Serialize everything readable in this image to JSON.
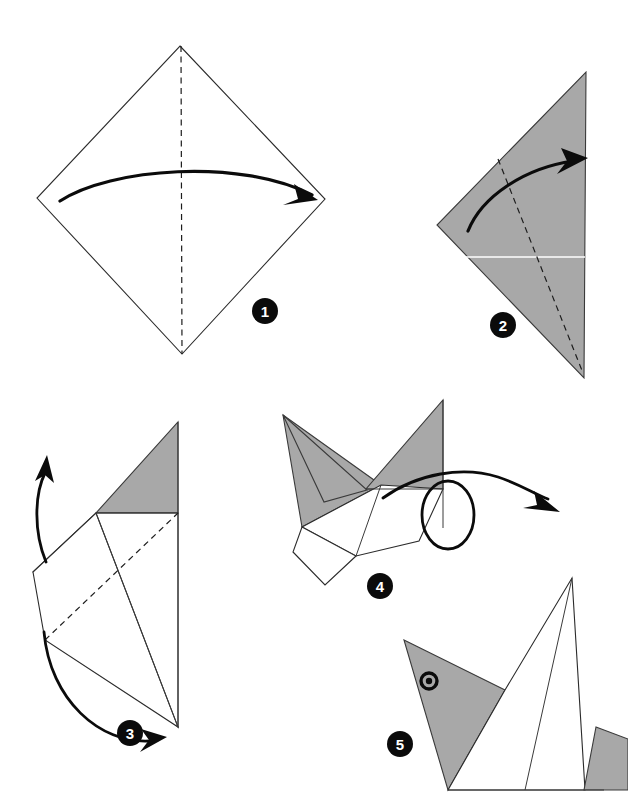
{
  "document": {
    "title": "Origami folding instructions",
    "subject": "paper bird / swan fold sequence",
    "background_color": "#ffffff",
    "width": 628,
    "height": 808
  },
  "palette": {
    "paper_front": "#ffffff",
    "paper_back": "#a8a8a8",
    "ink": "#2b2b2b",
    "arrow": "#0b0b0b",
    "badge_fill": "#0b0b0b",
    "badge_text": "#ffffff",
    "crease_highlight": "#ffffff"
  },
  "steps": [
    {
      "number": "1",
      "badge": {
        "cx": 265,
        "cy": 311,
        "r": 13
      },
      "caption": "Square sheet set as a diamond with a vertical centre crease; fold left point across to the right point.",
      "shape": "diamond",
      "polygon": "180,46 325,199 182,354 37,198",
      "creases": [
        {
          "kind": "dashed-valley",
          "path": "M 181,46 L 182,354"
        }
      ],
      "arrow": {
        "kind": "curved-fold-arrow",
        "path": "M 60,201 C 110,168 240,158 312,195",
        "head": "316,199 297,185 299,200 286,207"
      }
    },
    {
      "number": "2",
      "badge": {
        "cx": 503,
        "cy": 325,
        "r": 13
      },
      "caption": "Resulting triangle, coloured side up, with a horizontal raw edge and a dashed crease; fold the upper left flap over to the right.",
      "shape": "triangle",
      "polygon": "586,72 584,378 437,225",
      "creases": [
        {
          "kind": "white-raw-edge",
          "path": "M 437,257 L 585,257"
        },
        {
          "kind": "dashed-valley",
          "path": "M 498,159 L 583,373"
        }
      ],
      "arrow": {
        "kind": "curved-fold-arrow",
        "path": "M 468,231 C 482,196 525,168 573,161",
        "head": "584,159 562,150 568,162 560,173"
      }
    },
    {
      "number": "3",
      "badge": {
        "cx": 130,
        "cy": 733,
        "r": 13
      },
      "caption": "Narrow kite shape with a grey flap at the top and a dashed crease across the middle; swing the lower left flap upward.",
      "shape": "kite-with-flaps",
      "faces": [
        {
          "fill": "paper_back",
          "polygon": "178,422 178,513 96,513"
        },
        {
          "fill": "paper_front",
          "polygon": "96,513 178,513 178,727 33,572"
        },
        {
          "fill": "paper_front",
          "polygon": "33,572 96,513 178,727 45,640"
        }
      ],
      "creases": [
        {
          "kind": "edge",
          "path": "M 96,513 L 178,727"
        },
        {
          "kind": "edge",
          "path": "M 178,422 L 33,572"
        },
        {
          "kind": "dashed-valley",
          "path": "M 45,640 L 178,513"
        },
        {
          "kind": "edge",
          "path": "M 178,422 L 178,727"
        },
        {
          "kind": "edge",
          "path": "M 96,513 L 178,513"
        }
      ],
      "arrow_up": {
        "kind": "curved-fold-arrow",
        "path": "M 45,560 C 33,528 35,492 44,472",
        "head": "47,458 36,480 45,476 52,483"
      },
      "arrow_sweep": {
        "kind": "curved-fold-arrow",
        "path": "M 44,634 C 52,700 100,742 152,740",
        "head": "166,738 143,730 150,741 142,750"
      }
    },
    {
      "number": "4",
      "badge": {
        "cx": 380,
        "cy": 586,
        "r": 13
      },
      "caption": "Pointed head and wing flaps formed; turn the model over with a rotation arrow.",
      "shape": "head-and-wings",
      "faces": [
        {
          "fill": "paper_back",
          "polygon": "283,415 381,485 302,527"
        },
        {
          "fill": "paper_back",
          "polygon": "283,415 367,489 325,501"
        },
        {
          "fill": "paper_back",
          "polygon": "443,400 443,489 366,489"
        },
        {
          "fill": "paper_front",
          "polygon": "302,527 381,485 443,489 419,541 356,556"
        },
        {
          "fill": "paper_front",
          "polygon": "302,527 356,556 325,585 293,552"
        }
      ],
      "creases": [
        {
          "kind": "edge",
          "path": "M 366,489 L 443,489"
        },
        {
          "kind": "edge",
          "path": "M 381,485 L 356,556"
        },
        {
          "kind": "edge",
          "path": "M 302,527 L 356,556"
        },
        {
          "kind": "edge",
          "path": "M 443,400 L 443,528"
        }
      ],
      "arrow_rotate": {
        "kind": "loop-turnover-arrow",
        "loop": "M 383,497 C 430,470 498,468 530,481 C 566,496 573,540 546,554 C 515,570 485,545 495,515 C 506,484 548,472 512,481",
        "ellipse": {
          "cx": 447,
          "cy": 515,
          "rx": 25,
          "ry": 34
        },
        "path": "M 383,497 C 420,472 465,466 500,478",
        "tail": "M 500,478 C 545,495 548,545 517,552 C 486,559 466,530 483,505",
        "head": "521,505 500,499 509,511 498,519"
      }
    },
    {
      "number": "5",
      "badge": {
        "cx": 400,
        "cy": 744,
        "r": 13
      },
      "caption": "Finished bird: grey head with an eye, white body, raised tail.",
      "shape": "finished-bird",
      "faces": [
        {
          "fill": "paper_back",
          "polygon": "404,640 504,690 448,790"
        },
        {
          "fill": "paper_front",
          "polygon": "448,790 504,690 572,578 585,790"
        },
        {
          "fill": "paper_back",
          "polygon": "596,728 628,740 628,790 585,790"
        }
      ],
      "creases": [
        {
          "kind": "edge",
          "path": "M 572,578 L 525,790"
        },
        {
          "kind": "edge",
          "path": "M 448,790 L 603,790"
        },
        {
          "kind": "edge",
          "path": "M 572,578 L 585,790"
        }
      ],
      "eye": {
        "cx": 429,
        "cy": 681,
        "r_outer": 8,
        "r_pupil": 3.2
      }
    }
  ]
}
